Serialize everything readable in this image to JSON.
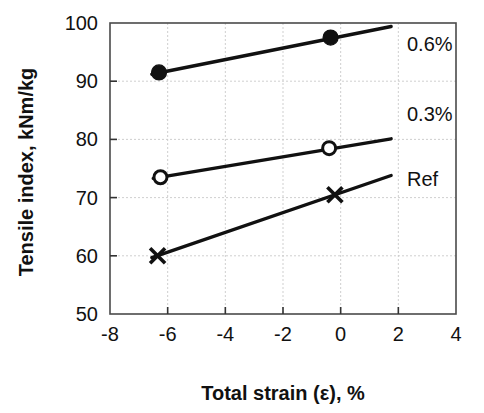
{
  "chart_data": {
    "type": "line",
    "title": "",
    "subtitle": "",
    "xlabel": "Total strain (ε), %",
    "ylabel": "Tensile index, kNm/kg",
    "xlim": [
      -8,
      4
    ],
    "ylim": [
      50,
      100
    ],
    "xticks": [
      -8,
      -6,
      -4,
      -2,
      0,
      2,
      4
    ],
    "xtick_labels": [
      "-8",
      "-6",
      "-4",
      "-2",
      "0",
      "2",
      "4"
    ],
    "yticks": [
      50,
      60,
      70,
      80,
      90,
      100
    ],
    "ytick_labels": [
      "50",
      "60",
      "70",
      "80",
      "90",
      "100"
    ],
    "grid": "horizontal and vertical dashed gridlines",
    "legend_position": "inline right of each series",
    "series": [
      {
        "name": "0.6%",
        "label": "0.6%",
        "marker": "filled-circle",
        "color": "#111111",
        "points": [
          {
            "x": -6.3,
            "y": 91.5
          },
          {
            "x": -0.35,
            "y": 97.5
          }
        ],
        "line_extent": [
          {
            "x": -6.55,
            "y": 91.2
          },
          {
            "x": 1.75,
            "y": 99.4
          }
        ],
        "label_x": 2.3,
        "label_y": 95.2
      },
      {
        "name": "0.3%",
        "label": "0.3%",
        "marker": "open-circle",
        "color": "#111111",
        "points": [
          {
            "x": -6.25,
            "y": 73.5
          },
          {
            "x": -0.4,
            "y": 78.5
          }
        ],
        "line_extent": [
          {
            "x": -6.5,
            "y": 73.3
          },
          {
            "x": 1.75,
            "y": 80.1
          }
        ],
        "label_x": 2.3,
        "label_y": 83.2
      },
      {
        "name": "Ref",
        "label": "Ref",
        "marker": "cross",
        "color": "#111111",
        "points": [
          {
            "x": -6.35,
            "y": 60.0
          },
          {
            "x": -0.2,
            "y": 70.5
          }
        ],
        "line_extent": [
          {
            "x": -6.55,
            "y": 59.7
          },
          {
            "x": 1.75,
            "y": 73.8
          }
        ],
        "label_x": 2.3,
        "label_y": 72.0
      }
    ]
  },
  "figure": {
    "background_color": "#ffffff",
    "axis_color": "#4a4a4a",
    "grid_color": "#c9c9c9",
    "data_color": "#111111"
  }
}
